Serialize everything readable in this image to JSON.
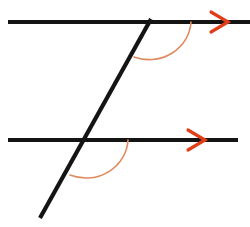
{
  "figure": {
    "canvas": {
      "width": 250,
      "height": 227,
      "background": "#ffffff"
    },
    "colors": {
      "line": "#141414",
      "arrow": "#E03E18",
      "arc": "#E08A5F"
    },
    "stroke_widths": {
      "parallel_line": 4.2,
      "transversal": 4.2,
      "arc": 1.6,
      "arrow": 3.2
    }
  },
  "elements": {
    "top_parallel_line": {
      "name": "top-parallel-line",
      "x1": 8,
      "y1": 22,
      "x2": 250,
      "y2": 22,
      "color": "#141414"
    },
    "bottom_parallel_line": {
      "name": "bottom-parallel-line",
      "x1": 8,
      "y1": 140,
      "x2": 238,
      "y2": 140,
      "color": "#141414"
    },
    "transversal_line": {
      "name": "transversal-line",
      "x1": 40,
      "y1": 218,
      "x2": 151,
      "y2": 19,
      "color": "#141414"
    },
    "top_arrow_marker": {
      "name": "top-parallel-arrow-marker",
      "tip_x": 228,
      "tip_y": 22,
      "back_x": 211,
      "back_y": 12,
      "back2_x": 211,
      "back2_y": 32,
      "color": "#E03E18"
    },
    "bottom_arrow_marker": {
      "name": "bottom-parallel-arrow-marker",
      "tip_x": 205,
      "tip_y": 140,
      "back_x": 188,
      "back_y": 130,
      "back2_x": 188,
      "back2_y": 150,
      "color": "#E03E18"
    },
    "top_angle_arc": {
      "name": "top-interior-angle-arc",
      "path": "M 191 22 A 42 40 0 0 1 134 57",
      "color": "#E08A5F"
    },
    "bottom_angle_arc": {
      "name": "bottom-interior-angle-arc",
      "path": "M 128 140 A 42 40 0 0 1 70 175",
      "color": "#E08A5F"
    }
  },
  "intersections": {
    "top": {
      "name": "top-intersection-point",
      "x": 148,
      "y": 22
    },
    "bottom": {
      "name": "bottom-intersection-point",
      "x": 85,
      "y": 140
    }
  }
}
